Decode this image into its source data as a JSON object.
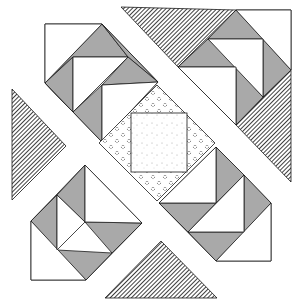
{
  "colors": {
    "background": "#ffffff",
    "stroke": "#1a1a1a",
    "gray": "#a9a9a9",
    "white": "#ffffff",
    "hatch": "#2a2a2a",
    "dot": "#333333",
    "speckle": "#9a9a9a"
  },
  "hatched_triangles": [
    {
      "name": "hatch-top",
      "points": "121,7 236,10 178,67"
    },
    {
      "name": "hatch-right",
      "points": "291,70 291,182 236,125"
    },
    {
      "name": "hatch-left",
      "points": "12,89 66,146 12,200"
    },
    {
      "name": "hatch-bottom",
      "points": "105,298 161,241 217,298"
    }
  ],
  "corner_blocks": [
    {
      "name": "block-top-left",
      "white": [
        "45,24 102,24 45,83",
        "73,57 128,57 73,112",
        "102,85 158,82 102,142"
      ],
      "gray": [
        "102,24 128,57 73,57 45,83 73,112 45,83",
        "102,24 158,82 128,57",
        "73,57 73,112 45,83",
        "73,112 102,85 102,142",
        "128,57 158,82 102,85"
      ],
      "outline": "45,24 102,24 158,82 102,142 45,83"
    },
    {
      "name": "block-top-right",
      "white": [
        "236,10 291,10 291,70",
        "208,39 263,39 263,97",
        "178,67 236,67 236,125"
      ],
      "gray": [
        "236,10 263,39 208,39",
        "208,39 236,67 178,67",
        "263,39 291,70 263,97",
        "236,67 263,97 236,125"
      ],
      "outline": "236,10 291,10 291,70 236,125 178,67"
    },
    {
      "name": "block-bottom-left",
      "white": [
        "31,221 31,280 86,280",
        "57,195 85,222 57,250",
        "85,165 142,223 85,222"
      ],
      "gray": [
        "85,165 85,222 57,195",
        "57,195 57,250 31,221",
        "85,222 142,223 112,253",
        "57,250 112,253 86,280"
      ],
      "outline": "85,165 142,223 86,280 31,280 31,221"
    },
    {
      "name": "block-bottom-right",
      "white": [
        "271,203 271,261 216,261",
        "244,175 244,232 188,232",
        "216,147 216,203 159,203"
      ],
      "gray": [
        "216,147 244,175 216,203",
        "244,175 271,203 244,232",
        "159,203 216,203 188,232",
        "188,232 244,232 216,261"
      ],
      "outline": "216,147 271,203 271,261 216,261 159,203"
    }
  ],
  "center": {
    "diamond": "157,85 215,143 157,201 99,143",
    "square": {
      "x": 131,
      "y": 113,
      "w": 56,
      "h": 59
    }
  }
}
